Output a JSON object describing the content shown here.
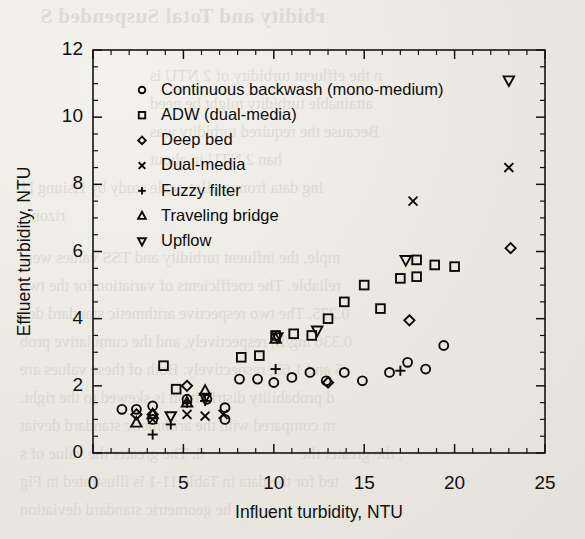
{
  "page": {
    "background_color": "#eceae4",
    "ink_color": "#0b0b0b",
    "showthrough": [
      {
        "text": "rbidity and Total Suspended S",
        "x": 40,
        "y": 4,
        "kind": "title"
      },
      {
        "text": "n the effluent turbidity of 2 NTU is",
        "x": 150,
        "y": 66,
        "kind": "body"
      },
      {
        "text": "attainable turbidity might be need",
        "x": 150,
        "y": 94,
        "kind": "body"
      },
      {
        "text": "Because the required turbidity was",
        "x": 150,
        "y": 122,
        "kind": "body"
      },
      {
        "text": "han 2 NTU in about",
        "x": 150,
        "y": 150,
        "kind": "body"
      },
      {
        "text": "ing data from a pilot-scale study by Hsiung [1",
        "x": 20,
        "y": 178,
        "kind": "body"
      },
      {
        "text": "rizona.",
        "x": 20,
        "y": 206,
        "kind": "body"
      },
      {
        "text": "mple, the influent turbidity and TSS values were",
        "x": 20,
        "y": 248,
        "kind": "body"
      },
      {
        "text": "reliable. The coefficients of variation for the two",
        "x": 20,
        "y": 276,
        "kind": "body"
      },
      {
        "text": "0.275. The two respective arithmetic standard dev",
        "x": 20,
        "y": 304,
        "kind": "body"
      },
      {
        "text": "0.336 mg/L, respectively, and the cumulative prob",
        "x": 20,
        "y": 332,
        "kind": "body"
      },
      {
        "text": "5 and 1.62, respectively. Both of these values are",
        "x": 20,
        "y": 360,
        "kind": "body"
      },
      {
        "text": "d probability distribution is skewed to the right.",
        "x": 20,
        "y": 388,
        "kind": "body"
      },
      {
        "text": "m compared with the arithmetic standard deviat",
        "x": 20,
        "y": 416,
        "kind": "body"
      },
      {
        "text": "0. The greater the value of s",
        "x": 20,
        "y": 444,
        "kind": "body"
      },
      {
        "text": ", the greater the",
        "x": 300,
        "y": 444,
        "kind": "body"
      },
      {
        "text": "ted for the data in Table 11-1 is illustrated in Fig",
        "x": 20,
        "y": 472,
        "kind": "body"
      },
      {
        "text": "he geometric standard deviation",
        "x": 20,
        "y": 500,
        "kind": "body"
      }
    ]
  },
  "chart_data": {
    "type": "scatter",
    "title": "",
    "xlabel": "Influent turbidity, NTU",
    "ylabel": "Effluent turbidity, NTU",
    "xlim": [
      0,
      25
    ],
    "ylim": [
      0,
      12
    ],
    "xticks": [
      0,
      5,
      10,
      15,
      20,
      25
    ],
    "yticks": [
      0,
      2,
      4,
      6,
      8,
      10,
      12
    ],
    "xtick_labels": [
      "0",
      "5",
      "10",
      "15",
      "20",
      "25"
    ],
    "ytick_labels": [
      "0",
      "2",
      "4",
      "6",
      "8",
      "10",
      "12"
    ],
    "x_minor_step": 1,
    "y_minor_step": 0.5,
    "grid": false,
    "legend_position": "upper-left-inside",
    "series": [
      {
        "name": "Continuous backwash (mono-medium)",
        "marker": "circle",
        "points": [
          [
            1.6,
            1.3
          ],
          [
            2.4,
            1.3
          ],
          [
            3.3,
            1.4
          ],
          [
            3.3,
            1.0
          ],
          [
            5.2,
            1.6
          ],
          [
            6.3,
            1.6
          ],
          [
            7.3,
            1.35
          ],
          [
            7.3,
            1.0
          ],
          [
            8.1,
            2.2
          ],
          [
            9.1,
            2.2
          ],
          [
            10.0,
            2.1
          ],
          [
            11.0,
            2.25
          ],
          [
            12.0,
            2.4
          ],
          [
            12.9,
            2.15
          ],
          [
            13.9,
            2.4
          ],
          [
            14.9,
            2.15
          ],
          [
            16.4,
            2.4
          ],
          [
            17.4,
            2.7
          ],
          [
            18.4,
            2.5
          ],
          [
            19.4,
            3.2
          ]
        ]
      },
      {
        "name": "ADW (dual-media)",
        "marker": "square",
        "points": [
          [
            3.9,
            2.6
          ],
          [
            4.6,
            1.9
          ],
          [
            8.2,
            2.85
          ],
          [
            9.2,
            2.9
          ],
          [
            10.1,
            3.5
          ],
          [
            11.1,
            3.55
          ],
          [
            12.1,
            3.5
          ],
          [
            13.0,
            4.0
          ],
          [
            13.9,
            4.5
          ],
          [
            15.0,
            5.0
          ],
          [
            15.9,
            4.3
          ],
          [
            17.0,
            5.2
          ],
          [
            17.9,
            5.25
          ],
          [
            17.9,
            5.75
          ],
          [
            18.9,
            5.6
          ],
          [
            20.0,
            5.55
          ]
        ]
      },
      {
        "name": "Deep bed",
        "marker": "diamond",
        "points": [
          [
            2.4,
            1.15
          ],
          [
            3.3,
            1.15
          ],
          [
            5.2,
            2.0
          ],
          [
            13.0,
            2.1
          ],
          [
            17.5,
            3.95
          ],
          [
            23.1,
            6.1
          ]
        ]
      },
      {
        "name": "Dual-media",
        "marker": "cross",
        "points": [
          [
            3.3,
            1.0
          ],
          [
            5.2,
            1.15
          ],
          [
            6.2,
            1.1
          ],
          [
            7.2,
            1.15
          ],
          [
            17.7,
            7.5
          ],
          [
            23.0,
            8.5
          ]
        ]
      },
      {
        "name": "Fuzzy filter",
        "marker": "plus",
        "points": [
          [
            3.3,
            0.55
          ],
          [
            4.3,
            0.85
          ],
          [
            5.2,
            1.5
          ],
          [
            6.2,
            1.55
          ],
          [
            10.1,
            2.5
          ],
          [
            17.0,
            2.45
          ]
        ]
      },
      {
        "name": "Traveling bridge",
        "marker": "triangle-up",
        "points": [
          [
            2.4,
            0.9
          ],
          [
            3.3,
            1.15
          ],
          [
            5.2,
            1.5
          ],
          [
            6.2,
            1.85
          ],
          [
            10.1,
            3.4
          ]
        ]
      },
      {
        "name": "Upflow",
        "marker": "triangle-down",
        "points": [
          [
            4.3,
            1.1
          ],
          [
            6.2,
            1.65
          ],
          [
            10.2,
            3.45
          ],
          [
            12.4,
            3.65
          ],
          [
            17.3,
            5.75
          ],
          [
            23.0,
            11.1
          ]
        ]
      }
    ]
  }
}
